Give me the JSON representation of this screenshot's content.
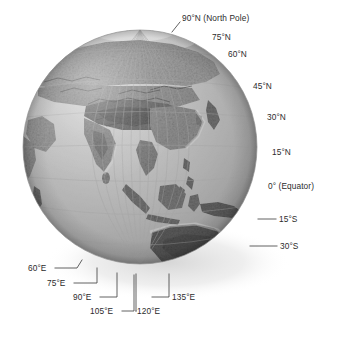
{
  "figure": {
    "type": "globe-graticule-diagram",
    "background_color": "#ffffff",
    "globe": {
      "center_x": 140,
      "center_y": 147,
      "radius": 117,
      "ocean_color": "#b9b9b9",
      "land_color": "#8a8a8a",
      "highland_color": "#5f5f5f",
      "ice_color": "#e4e4e4",
      "graticule_color": "#a2a2a2",
      "shadow_color": "#dedede",
      "center_longitude": "95°E",
      "center_latitude": "15°N"
    },
    "latitude_labels": [
      {
        "text": "90°N (North Pole)",
        "x": 182,
        "y": 18,
        "anchor": "start",
        "leader": "M 180 22 L 172 32"
      },
      {
        "text": "75°N",
        "x": 212,
        "y": 37,
        "anchor": "start",
        "leader": ""
      },
      {
        "text": "60°N",
        "x": 228,
        "y": 54,
        "anchor": "start",
        "leader": ""
      },
      {
        "text": "45°N",
        "x": 253,
        "y": 86,
        "anchor": "start",
        "leader": ""
      },
      {
        "text": "30°N",
        "x": 267,
        "y": 117,
        "anchor": "start",
        "leader": ""
      },
      {
        "text": "15°N",
        "x": 272,
        "y": 152,
        "anchor": "start",
        "leader": ""
      },
      {
        "text": "0° (Equator)",
        "x": 268,
        "y": 186,
        "anchor": "start",
        "leader": ""
      },
      {
        "text": "15°S",
        "x": 279,
        "y": 222,
        "anchor": "start",
        "leader": "M 258 219 L 276 219"
      },
      {
        "text": "30°S",
        "x": 280,
        "y": 249,
        "anchor": "start",
        "leader": "M 250 246 L 277 246"
      }
    ],
    "longitude_labels": [
      {
        "text": "60°E",
        "x": 28,
        "y": 271,
        "anchor": "start",
        "leader": "M 55 268 L 77 268 L 82 260"
      },
      {
        "text": "75°E",
        "x": 47,
        "y": 286,
        "anchor": "start",
        "leader": "M 74 283 L 97 283 L 97 268"
      },
      {
        "text": "90°E",
        "x": 73,
        "y": 300,
        "anchor": "start",
        "leader": "M 100 297 L 117 297 L 117 273"
      },
      {
        "text": "105°E",
        "x": 90,
        "y": 314,
        "anchor": "start",
        "leader": "M 122 311 L 134 311 L 134 275"
      },
      {
        "text": "120°E",
        "x": 137,
        "y": 314,
        "anchor": "start",
        "leader": "M 136 311 L 136 311 M 136 311 L 136 274"
      },
      {
        "text": "135°E",
        "x": 172,
        "y": 300,
        "anchor": "start",
        "leader": "M 152 297 L 169 297 L 169 274"
      }
    ],
    "text_color": "#2b2b2b",
    "leader_color": "#3a3a3a"
  }
}
